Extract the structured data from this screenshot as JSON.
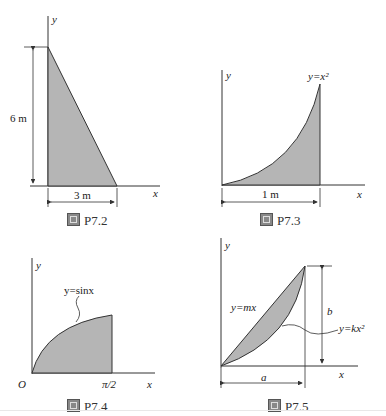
{
  "figures": [
    {
      "id": "P7.2",
      "caption_prefix": "图",
      "caption": "P7.2",
      "axis_x": "x",
      "axis_y": "y",
      "shape": "right triangle",
      "dims": {
        "height": "6 m",
        "base": "3 m"
      }
    },
    {
      "id": "P7.3",
      "caption_prefix": "图",
      "caption": "P7.3",
      "axis_x": "x",
      "axis_y": "y",
      "curve": "y=x²",
      "dims": {
        "base": "1 m"
      }
    },
    {
      "id": "P7.4",
      "caption_prefix": "图",
      "caption": "P7.4",
      "axis_x": "x",
      "axis_y": "y",
      "origin": "O",
      "curve": "y=sinx",
      "x_end": "π/2"
    },
    {
      "id": "P7.5",
      "caption_prefix": "图",
      "caption": "P7.5",
      "axis_x": "x",
      "axis_y": "y",
      "line": "y=mx",
      "curve": "y=kx²",
      "dims": {
        "width": "a",
        "height": "b"
      }
    }
  ],
  "colors": {
    "fill": "#b5b5b5",
    "stroke": "#333333"
  }
}
